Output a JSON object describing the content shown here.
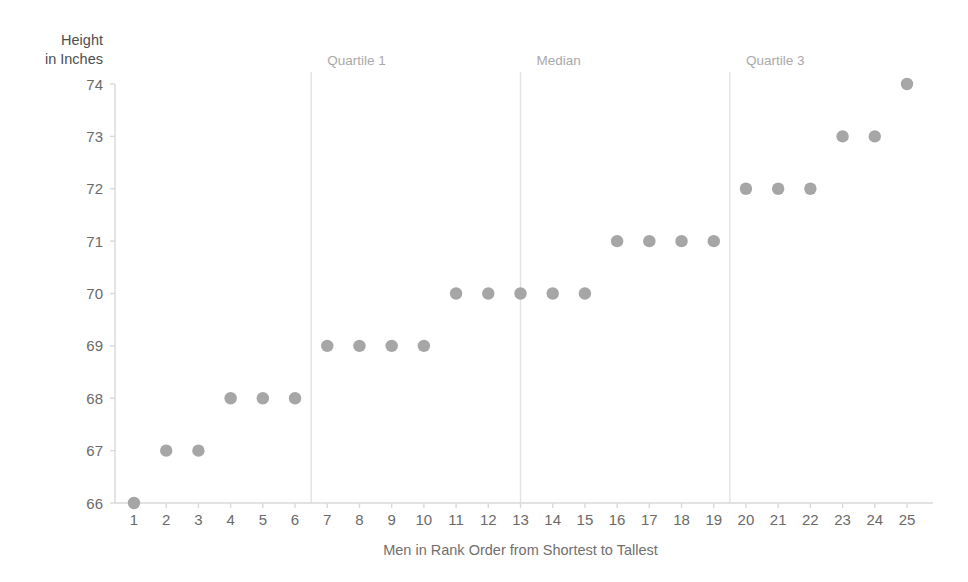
{
  "chart_data": {
    "type": "scatter",
    "title": "",
    "xlabel": "Men in Rank Order from Shortest to Tallest",
    "ylabel": "Height in Inches",
    "ylabel_lines": [
      "Height",
      "in Inches"
    ],
    "x": [
      1,
      2,
      3,
      4,
      5,
      6,
      7,
      8,
      9,
      10,
      11,
      12,
      13,
      14,
      15,
      16,
      17,
      18,
      19,
      20,
      21,
      22,
      23,
      24,
      25
    ],
    "values": [
      66,
      67,
      67,
      68,
      68,
      68,
      69,
      69,
      69,
      69,
      70,
      70,
      70,
      70,
      70,
      71,
      71,
      71,
      71,
      72,
      72,
      72,
      73,
      73,
      74
    ],
    "xticklabels": [
      "1",
      "2",
      "3",
      "4",
      "5",
      "6",
      "7",
      "8",
      "9",
      "10",
      "11",
      "12",
      "13",
      "14",
      "15",
      "16",
      "17",
      "18",
      "19",
      "20",
      "21",
      "22",
      "23",
      "24",
      "25"
    ],
    "yticklabels": [
      "66",
      "67",
      "68",
      "69",
      "70",
      "71",
      "72",
      "73",
      "74"
    ],
    "yticks": [
      66,
      67,
      68,
      69,
      70,
      71,
      72,
      73,
      74
    ],
    "xlim": [
      0.45,
      25.55
    ],
    "ylim": [
      66,
      74
    ],
    "grid": false,
    "legend": null,
    "marker_color": "#a6a6a6",
    "axis_color": "#d9d9d9",
    "annotation_line_color": "#e2e2e2",
    "annotations": [
      {
        "label": "Quartile 1",
        "x": 6.5,
        "label_x": 7.0
      },
      {
        "label": "Median",
        "x": 13.0,
        "label_x": 13.5
      },
      {
        "label": "Quartile 3",
        "x": 19.5,
        "label_x": 20.0
      }
    ]
  },
  "colors": {
    "marker": "#a6a6a6",
    "axis": "#d9d9d9",
    "annotation_line": "#e2e2e2",
    "tick_label": "#6a6a6a",
    "annotation_label": "#a9a9a9",
    "axis_title": "#6f6f6f",
    "background": "#ffffff"
  }
}
